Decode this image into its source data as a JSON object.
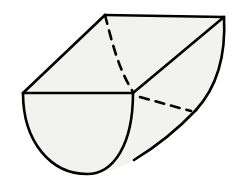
{
  "figure": {
    "name": "half-cylinder-solid",
    "title": "Half cylinder (semicircular prism) in oblique 3D view",
    "background_color": "#ffffff",
    "fill_color": "#f2f2f0",
    "stroke_color": "#000000",
    "dashed_stroke_color": "#000000",
    "stroke_width": 2.6,
    "dashed_stroke_width": 2.6,
    "dash_pattern": "9 7",
    "width": 232,
    "height": 196
  },
  "geometry": {
    "vertices": {
      "top_back_left": [
        105,
        15
      ],
      "top_back_right": [
        224,
        17
      ],
      "top_front_left": [
        23,
        93
      ],
      "top_front_right": [
        133,
        93
      ],
      "bottom_front": [
        87,
        174
      ],
      "bottom_meet": [
        134,
        160
      ],
      "right_end_bottom": [
        196,
        110
      ]
    },
    "faces": [
      {
        "name": "top-rectangular-face",
        "kind": "visible-planar",
        "points": "105,15 224,17 133,93 23,93"
      },
      {
        "name": "front-semicircular-face",
        "kind": "visible-semicircle",
        "flat_edge_from": [
          23,
          93
        ],
        "flat_edge_to": [
          133,
          93
        ],
        "arc_bottom": [
          87,
          174
        ],
        "radius_x": 55,
        "radius_y": 80
      },
      {
        "name": "curved-lateral-surface",
        "kind": "visible-curved",
        "from": [
          133,
          93
        ],
        "to": [
          224,
          17
        ]
      }
    ],
    "edges": [
      {
        "name": "top-back-edge",
        "style": "solid",
        "from": [
          105,
          15
        ],
        "to": [
          224,
          17
        ]
      },
      {
        "name": "top-left-slant-edge",
        "style": "solid",
        "from": [
          105,
          15
        ],
        "to": [
          23,
          93
        ]
      },
      {
        "name": "top-front-edge",
        "style": "solid",
        "from": [
          23,
          93
        ],
        "to": [
          133,
          93
        ]
      },
      {
        "name": "top-diagonal-edge",
        "style": "solid",
        "from": [
          133,
          93
        ],
        "to": [
          224,
          17
        ]
      },
      {
        "name": "front-semicircle-arc",
        "style": "solid",
        "from": [
          23,
          93
        ],
        "to": [
          133,
          93
        ]
      },
      {
        "name": "bottom-silhouette-edge",
        "style": "solid",
        "from": [
          134,
          160
        ],
        "to": [
          224,
          17
        ]
      },
      {
        "name": "right-end-arc",
        "style": "solid",
        "from": [
          224,
          17
        ],
        "to": [
          196,
          110
        ]
      },
      {
        "name": "hidden-back-semicircle-arc",
        "style": "dashed",
        "from": [
          105,
          15
        ],
        "to": [
          133,
          93
        ]
      },
      {
        "name": "hidden-back-arc-continuation",
        "style": "dashed",
        "from": [
          140,
          96
        ],
        "to": [
          190,
          111
        ]
      }
    ]
  }
}
